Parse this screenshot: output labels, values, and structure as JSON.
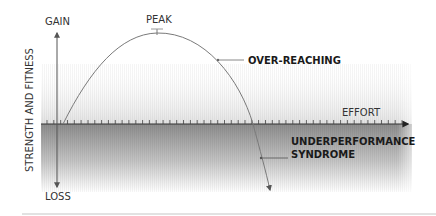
{
  "diagram": {
    "y_axis": {
      "label": "STRENGTH AND FITNESS",
      "top_label": "GAIN",
      "bottom_label": "LOSS"
    },
    "x_axis": {
      "label": "EFFORT",
      "tick_count": 53
    },
    "curve": {
      "peak_label": "PEAK",
      "annotations": [
        {
          "label_lines": [
            "OVER-REACHING"
          ]
        },
        {
          "label_lines": [
            "UNDERPERFORMANCE",
            "SYNDROME"
          ]
        }
      ]
    },
    "colors": {
      "axis": "#555555",
      "curve": "#7a7a7a",
      "band_light": "#e6e6e6",
      "band_dark": "#8f8f8f",
      "text": "#333333",
      "divider": "#d8d8d8"
    }
  }
}
